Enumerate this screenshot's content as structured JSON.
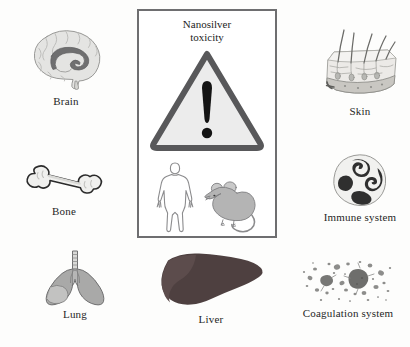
{
  "figure": {
    "background_color": "#fdfdfc",
    "caption_color": "#262626"
  },
  "central_panel": {
    "title_line1": "Nanosilver",
    "title_line2": "toxicity",
    "border_color": "#6e6e70",
    "warning_icon": {
      "name": "warning-triangle-icon",
      "stroke_color": "#58585a",
      "fill_color": "#ececec",
      "mark_color": "#141414"
    },
    "specimens": [
      {
        "name": "human-figure",
        "label": "human",
        "color": "#8c8c8e"
      },
      {
        "name": "mouse-figure",
        "label": "mouse",
        "color": "#a8a8aa"
      }
    ]
  },
  "organs": [
    {
      "id": "brain",
      "label": "Brain",
      "icon": "brain-icon",
      "colors": {
        "light": "#e3e3e1",
        "mid": "#c9c9c6",
        "dark": "#6f6f70"
      }
    },
    {
      "id": "bone",
      "label": "Bone",
      "icon": "bone-icon",
      "colors": {
        "light": "#f2f2f0",
        "mid": "#d8d8d4",
        "dark": "#2b2b2b"
      }
    },
    {
      "id": "lung",
      "label": "Lung",
      "icon": "lung-icon",
      "colors": {
        "light": "#d2d2d0",
        "mid": "#9d9d9c",
        "dark": "#6a6a6b"
      }
    },
    {
      "id": "liver",
      "label": "Liver",
      "icon": "liver-icon",
      "colors": {
        "light": "#5d4b4b",
        "mid": "#4a3c3c",
        "dark": "#3b3030"
      }
    },
    {
      "id": "skin",
      "label": "Skin",
      "icon": "skin-icon",
      "colors": {
        "light": "#e8e8e6",
        "mid": "#c2c2be",
        "dark": "#7d7d7a"
      }
    },
    {
      "id": "immune-system",
      "label": "Immune system",
      "icon": "immune-cell-icon",
      "colors": {
        "light": "#f0f0ee",
        "mid": "#cfcfcc",
        "dark": "#2f2f2f"
      }
    },
    {
      "id": "coagulation-system",
      "label": "Coagulation system",
      "icon": "platelets-icon",
      "colors": {
        "light": "#bdbdbb",
        "mid": "#8a8a88",
        "dark": "#555555"
      }
    }
  ]
}
